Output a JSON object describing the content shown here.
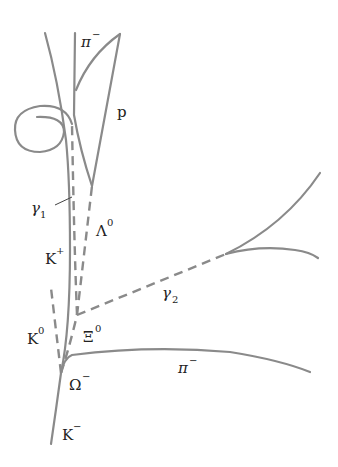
{
  "diagram": {
    "colors": {
      "track": "#8a8a8a",
      "label": "#222222",
      "background": "#ffffff"
    },
    "labels": {
      "pi_minus_top": {
        "base": "π",
        "sup": "−"
      },
      "proton": {
        "base": "p"
      },
      "gamma1": {
        "base": "γ",
        "sub": "1"
      },
      "lambda0": {
        "base": "Λ",
        "sup": "0"
      },
      "k_plus": {
        "base": "K",
        "sup": "+"
      },
      "gamma2": {
        "base": "γ",
        "sub": "2"
      },
      "k0": {
        "base": "K",
        "sup": "0"
      },
      "xi0": {
        "base": "Ξ",
        "sup": "0"
      },
      "omega_minus": {
        "base": "Ω",
        "sup": "−"
      },
      "pi_minus_bottom": {
        "base": "π",
        "sup": "−"
      },
      "k_minus": {
        "base": "K",
        "sup": "−"
      }
    },
    "tracks": {
      "charged": [
        "K−",
        "K+",
        "π− (top)",
        "p",
        "π− (bottom)",
        "e+e− pair (γ1 spiral)",
        "e+e− pair (γ2)"
      ],
      "neutral": [
        "K0",
        "Ξ0",
        "Λ0",
        "γ1",
        "γ2"
      ]
    }
  }
}
